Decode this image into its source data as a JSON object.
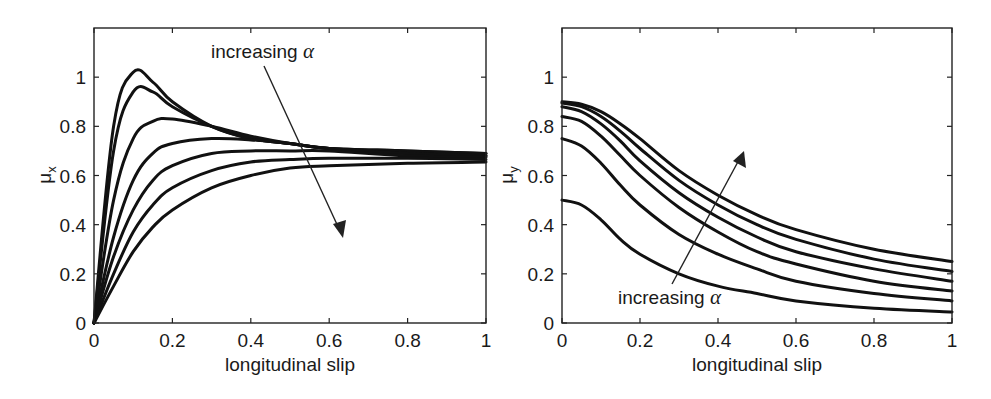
{
  "chart_data": [
    {
      "type": "line",
      "title": "",
      "xlabel": "longitudinal slip",
      "ylabel": "μx",
      "ylabel_main": "μ",
      "ylabel_sub": "x",
      "xlim": [
        0,
        1
      ],
      "ylim": [
        0,
        1.2
      ],
      "xticks": [
        0,
        0.2,
        0.4,
        0.6,
        0.8,
        1
      ],
      "xtick_labels": [
        "0",
        "0.2",
        "0.4",
        "0.6",
        "0.8",
        "1"
      ],
      "yticks": [
        0,
        0.2,
        0.4,
        0.6,
        0.8,
        1
      ],
      "ytick_labels": [
        "0",
        "0.2",
        "0.4",
        "0.6",
        "0.8",
        "1"
      ],
      "grid": false,
      "legend": null,
      "annotation": {
        "text": "increasing ",
        "symbol": "α",
        "arrow_direction": "down-right"
      },
      "x": [
        0,
        0.05,
        0.1,
        0.15,
        0.2,
        0.3,
        0.4,
        0.5,
        0.6,
        0.8,
        1.0
      ],
      "series": [
        {
          "name": "α1",
          "values": [
            0,
            0.8,
            1.02,
            0.98,
            0.9,
            0.8,
            0.75,
            0.73,
            0.71,
            0.7,
            0.69
          ]
        },
        {
          "name": "α2",
          "values": [
            0,
            0.7,
            0.94,
            0.94,
            0.88,
            0.8,
            0.75,
            0.73,
            0.71,
            0.7,
            0.69
          ]
        },
        {
          "name": "α3",
          "values": [
            0,
            0.5,
            0.75,
            0.82,
            0.83,
            0.8,
            0.76,
            0.73,
            0.71,
            0.69,
            0.68
          ]
        },
        {
          "name": "α4",
          "values": [
            0,
            0.35,
            0.58,
            0.69,
            0.73,
            0.75,
            0.745,
            0.73,
            0.71,
            0.69,
            0.68
          ]
        },
        {
          "name": "α5",
          "values": [
            0,
            0.27,
            0.46,
            0.58,
            0.64,
            0.69,
            0.7,
            0.7,
            0.7,
            0.68,
            0.675
          ]
        },
        {
          "name": "α6",
          "values": [
            0,
            0.2,
            0.37,
            0.48,
            0.55,
            0.62,
            0.655,
            0.665,
            0.67,
            0.67,
            0.665
          ]
        },
        {
          "name": "α7",
          "values": [
            0,
            0.15,
            0.29,
            0.39,
            0.46,
            0.55,
            0.6,
            0.63,
            0.64,
            0.65,
            0.655
          ]
        }
      ]
    },
    {
      "type": "line",
      "title": "",
      "xlabel": "longitudinal slip",
      "ylabel": "μy",
      "ylabel_main": "μ",
      "ylabel_sub": "y",
      "xlim": [
        0,
        1
      ],
      "ylim": [
        0,
        1.2
      ],
      "xticks": [
        0,
        0.2,
        0.4,
        0.6,
        0.8,
        1
      ],
      "xtick_labels": [
        "0",
        "0.2",
        "0.4",
        "0.6",
        "0.8",
        "1"
      ],
      "yticks": [
        0,
        0.2,
        0.4,
        0.6,
        0.8,
        1
      ],
      "ytick_labels": [
        "0",
        "0.2",
        "0.4",
        "0.6",
        "0.8",
        "1"
      ],
      "grid": false,
      "legend": null,
      "annotation": {
        "text": "increasing ",
        "symbol": "α",
        "arrow_direction": "up-right"
      },
      "x": [
        0,
        0.05,
        0.1,
        0.15,
        0.2,
        0.3,
        0.4,
        0.5,
        0.6,
        0.8,
        1.0
      ],
      "series": [
        {
          "name": "α6",
          "values": [
            0.9,
            0.89,
            0.86,
            0.81,
            0.75,
            0.62,
            0.52,
            0.44,
            0.38,
            0.3,
            0.25
          ]
        },
        {
          "name": "α5",
          "values": [
            0.895,
            0.88,
            0.84,
            0.78,
            0.71,
            0.58,
            0.48,
            0.4,
            0.34,
            0.26,
            0.21
          ]
        },
        {
          "name": "α4",
          "values": [
            0.88,
            0.86,
            0.81,
            0.74,
            0.66,
            0.53,
            0.43,
            0.35,
            0.29,
            0.22,
            0.17
          ]
        },
        {
          "name": "α3",
          "values": [
            0.84,
            0.82,
            0.76,
            0.68,
            0.6,
            0.47,
            0.37,
            0.29,
            0.24,
            0.17,
            0.13
          ]
        },
        {
          "name": "α2",
          "values": [
            0.75,
            0.72,
            0.65,
            0.56,
            0.48,
            0.36,
            0.28,
            0.22,
            0.17,
            0.12,
            0.09
          ]
        },
        {
          "name": "α1",
          "values": [
            0.5,
            0.48,
            0.42,
            0.34,
            0.28,
            0.2,
            0.15,
            0.12,
            0.09,
            0.06,
            0.045
          ]
        }
      ]
    }
  ],
  "colors": {
    "line": "#111111",
    "axes": "#222222",
    "background": "#ffffff"
  }
}
